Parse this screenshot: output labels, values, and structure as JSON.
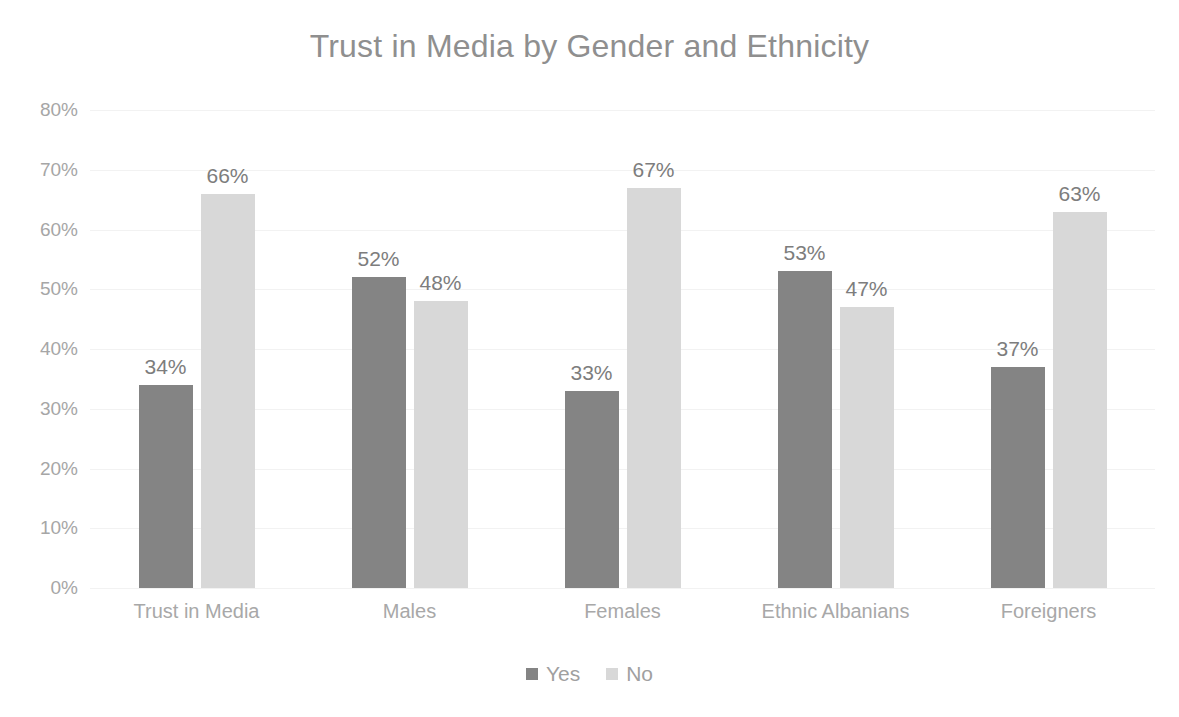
{
  "chart_data": {
    "type": "bar",
    "title": "Trust in Media by Gender and Ethnicity",
    "xlabel": "",
    "ylabel": "",
    "ylim": [
      0,
      80
    ],
    "y_tick_labels": [
      "80%",
      "70%",
      "60%",
      "50%",
      "40%",
      "30%",
      "20%",
      "10%",
      "0%"
    ],
    "y_tick_values": [
      80,
      70,
      60,
      50,
      40,
      30,
      20,
      10,
      0
    ],
    "grid": true,
    "grid_axis": "y",
    "legend_position": "bottom",
    "data_labels": true,
    "data_label_suffix": "%",
    "categories": [
      "Trust in Media",
      "Males",
      "Females",
      "Ethnic Albanians",
      "Foreigners"
    ],
    "series": [
      {
        "name": "Yes",
        "color": "#848484",
        "values": [
          34,
          52,
          33,
          53,
          37
        ],
        "labels": [
          "34%",
          "52%",
          "33%",
          "53%",
          "37%"
        ]
      },
      {
        "name": "No",
        "color": "#d8d8d8",
        "values": [
          66,
          48,
          67,
          47,
          63
        ],
        "labels": [
          "66%",
          "48%",
          "67%",
          "47%",
          "63%"
        ]
      }
    ]
  },
  "colors": {
    "background": "#ffffff",
    "title_text": "#8f8f8f",
    "axis_text": "#a6a6a6",
    "data_label_text": "#7d7d7d",
    "gridline": "#f2f2f2",
    "series_yes": "#848484",
    "series_no": "#d8d8d8"
  }
}
